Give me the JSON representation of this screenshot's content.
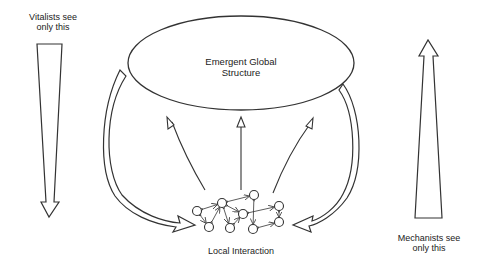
{
  "diagram": {
    "labels": {
      "vitalists": "Vitalists see only this",
      "vitalists_line1": "Vitalists see",
      "vitalists_line2": "only this",
      "mechanists_line1": "Mechanists see",
      "mechanists_line2": "only this",
      "global_line1": "Emergent Global",
      "global_line2": "Structure",
      "local": "Local Interaction"
    },
    "stroke_color": "#333333",
    "background": "#ffffff",
    "nodes": [
      "a",
      "b",
      "c",
      "d",
      "e",
      "f",
      "g",
      "h",
      "i"
    ],
    "edges": [
      [
        "a",
        "b"
      ],
      [
        "a",
        "e"
      ],
      [
        "e",
        "b"
      ],
      [
        "b",
        "c"
      ],
      [
        "b",
        "d"
      ],
      [
        "b",
        "f"
      ],
      [
        "f",
        "d"
      ],
      [
        "d",
        "h"
      ],
      [
        "c",
        "g"
      ],
      [
        "h",
        "i"
      ],
      [
        "g",
        "i"
      ]
    ]
  }
}
